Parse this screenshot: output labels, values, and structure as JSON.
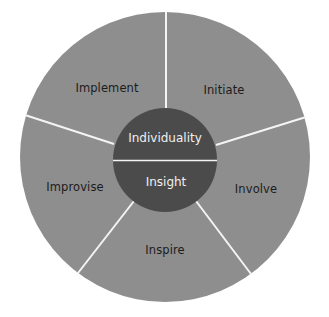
{
  "diagram": {
    "type": "segmented-circle",
    "colors": {
      "background": "#ffffff",
      "outer_fill": "#8e8e8e",
      "inner_fill": "#4b4b4b",
      "divider": "#f4f4f4",
      "outer_text": "#1c1c1c",
      "inner_text": "#f0f0f0"
    },
    "core": {
      "top_label": "Individuality",
      "bottom_label": "Insight"
    },
    "segments": [
      {
        "id": "implement",
        "label": "Implement"
      },
      {
        "id": "initiate",
        "label": "Initiate"
      },
      {
        "id": "involve",
        "label": "Involve"
      },
      {
        "id": "inspire",
        "label": "Inspire"
      },
      {
        "id": "improvise",
        "label": "Improvise"
      }
    ]
  }
}
